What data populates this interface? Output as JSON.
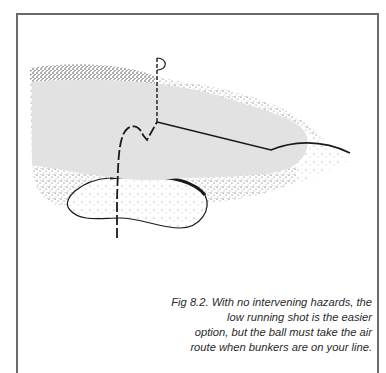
{
  "figure": {
    "label": "Fig 8.2.",
    "caption_lines": [
      "Fig 8.2. With no intervening hazards, the",
      "low running shot is the easier",
      "option, but the ball must take the air",
      "route when bunkers are on your line."
    ],
    "elements": {
      "green": "putting-green",
      "flag": "flagstick",
      "bunker": "greenside-bunker",
      "rough": "stippled-fringe",
      "shot_low": "low running shot path",
      "shot_air": "lofted shot path over bunker"
    },
    "colors": {
      "green_fill": "#e2e2e2",
      "ink": "#1a1a1a",
      "frame": "#6a6a6a"
    }
  }
}
